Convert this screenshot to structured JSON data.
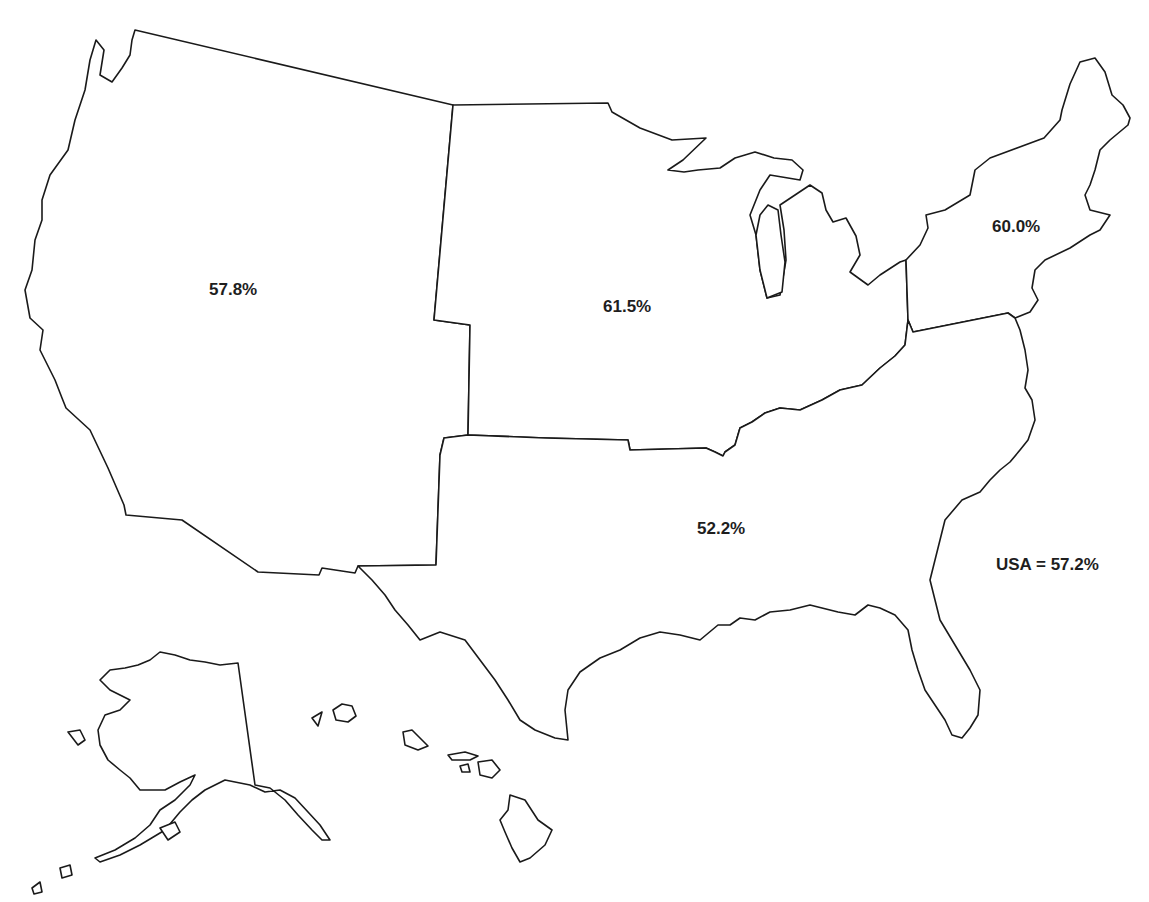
{
  "map": {
    "type": "choropleth-outline",
    "subject": "United States census regions",
    "stroke_color": "#1a1a1a",
    "fill_color": "#ffffff",
    "background": "#ffffff"
  },
  "regions": [
    {
      "id": "west",
      "name": "West",
      "label": "57.8%",
      "value": 57.8
    },
    {
      "id": "midwest",
      "name": "Midwest",
      "label": "61.5%",
      "value": 61.5
    },
    {
      "id": "northeast",
      "name": "Northeast",
      "label": "60.0%",
      "value": 60.0
    },
    {
      "id": "south",
      "name": "South",
      "label": "52.2%",
      "value": 52.2
    }
  ],
  "total": {
    "label": "USA = 57.2%",
    "value": 57.2
  },
  "insets": [
    "Alaska",
    "Hawaii"
  ]
}
